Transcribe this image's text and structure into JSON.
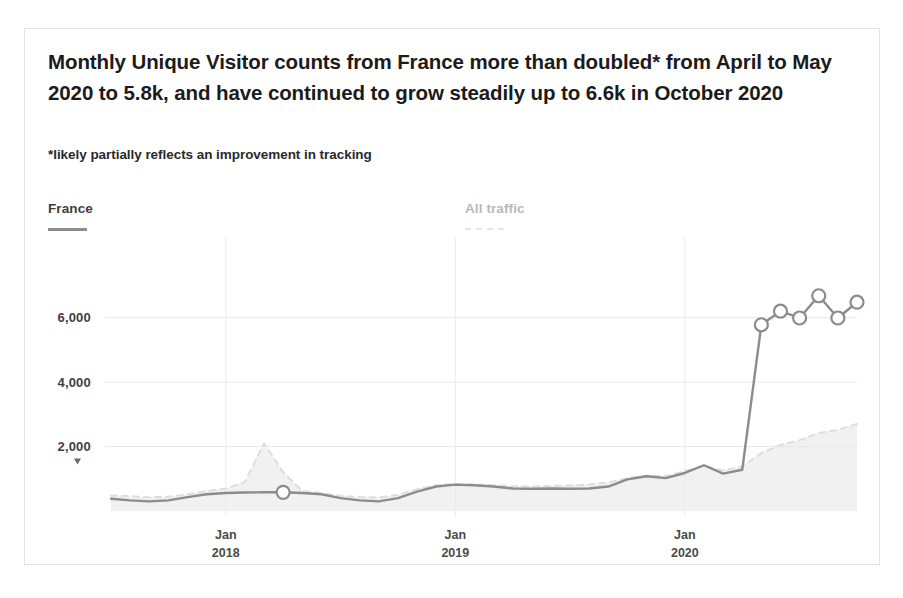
{
  "card": {
    "headline": "Monthly Unique Visitor counts from France more than doubled* from April to May 2020 to 5.8k, and have continued to grow steadily up to 6.6k in October 2020",
    "subhead": "*likely partially reflects an improvement in tracking"
  },
  "legend": {
    "france": {
      "label": "France",
      "color": "#8c8c8c",
      "style": "solid"
    },
    "all_traffic": {
      "label": "All traffic",
      "color": "#e4e4e4",
      "style": "dashed"
    }
  },
  "chart_data": {
    "type": "line",
    "title": "Monthly Unique Visitor counts from France more than doubled* from April to May 2020 to 5.8k, and have continued to grow steadily up to 6.6k in October 2020",
    "subtitle": "*likely partially reflects an improvement in tracking",
    "xlabel": "",
    "ylabel": "",
    "grid": true,
    "legend_position": "top",
    "ylim": [
      0,
      7200
    ],
    "yticks": [
      2000,
      4000,
      6000
    ],
    "ytick_labels": [
      "2,000",
      "4,000",
      "6,000"
    ],
    "xtick_labels": [
      {
        "line1": "Jan",
        "line2": "2018"
      },
      {
        "line1": "Jan",
        "line2": "2019"
      },
      {
        "line1": "Jan",
        "line2": "2020"
      }
    ],
    "x": [
      "2017-07",
      "2017-08",
      "2017-09",
      "2017-10",
      "2017-11",
      "2017-12",
      "2018-01",
      "2018-02",
      "2018-03",
      "2018-04",
      "2018-05",
      "2018-06",
      "2018-07",
      "2018-08",
      "2018-09",
      "2018-10",
      "2018-11",
      "2018-12",
      "2019-01",
      "2019-02",
      "2019-03",
      "2019-04",
      "2019-05",
      "2019-06",
      "2019-07",
      "2019-08",
      "2019-09",
      "2019-10",
      "2019-11",
      "2019-12",
      "2020-01",
      "2020-02",
      "2020-03",
      "2020-04",
      "2020-05",
      "2020-06",
      "2020-07",
      "2020-08",
      "2020-09",
      "2020-10"
    ],
    "series": [
      {
        "name": "France",
        "color": "#8c8c8c",
        "style": "solid",
        "marker_indices": [
          9,
          34,
          35,
          36,
          37,
          38,
          39
        ],
        "values": [
          380,
          330,
          300,
          330,
          430,
          520,
          560,
          575,
          580,
          580,
          560,
          520,
          400,
          330,
          300,
          400,
          600,
          760,
          820,
          800,
          760,
          700,
          690,
          700,
          690,
          700,
          760,
          980,
          1080,
          1020,
          1180,
          1420,
          1160,
          1280,
          5780,
          6200,
          5990,
          6680,
          5990,
          6480
        ]
      },
      {
        "name": "All traffic",
        "color": "#dedede",
        "style": "dashed",
        "values": [
          480,
          460,
          430,
          440,
          520,
          620,
          700,
          900,
          2100,
          1200,
          620,
          560,
          470,
          430,
          420,
          500,
          680,
          800,
          840,
          820,
          800,
          770,
          760,
          780,
          790,
          820,
          880,
          1020,
          1100,
          1080,
          1240,
          1400,
          1260,
          1380,
          1800,
          2050,
          2200,
          2420,
          2520,
          2700
        ]
      }
    ],
    "annotations": [
      {
        "kind": "marker",
        "x": "2018-04",
        "y": 580
      },
      {
        "kind": "marker",
        "x": "2020-05",
        "y": 5780
      },
      {
        "kind": "marker",
        "x": "2020-06",
        "y": 6200
      },
      {
        "kind": "marker",
        "x": "2020-07",
        "y": 5990
      },
      {
        "kind": "marker",
        "x": "2020-08",
        "y": 6680
      },
      {
        "kind": "marker",
        "x": "2020-09",
        "y": 5990
      },
      {
        "kind": "marker",
        "x": "2020-10",
        "y": 6480
      }
    ]
  }
}
